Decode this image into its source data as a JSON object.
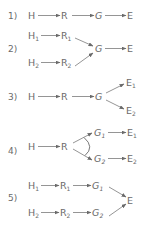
{
  "diagram": {
    "colors": {
      "text": "#6a6a6a",
      "line": "#7a7a7a",
      "background": "#ffffff"
    },
    "rows": [
      {
        "label": "1)",
        "nodes": [
          {
            "id": "H",
            "text": "H",
            "sub": ""
          },
          {
            "id": "R",
            "text": "R",
            "sub": ""
          },
          {
            "id": "G",
            "text": "G",
            "sub": ""
          },
          {
            "id": "E",
            "text": "E",
            "sub": ""
          }
        ],
        "edges": [
          [
            "H",
            "R"
          ],
          [
            "R",
            "G"
          ],
          [
            "G",
            "E"
          ]
        ]
      },
      {
        "label": "2)",
        "nodes": [
          {
            "id": "H1",
            "text": "H",
            "sub": "1"
          },
          {
            "id": "R1",
            "text": "R",
            "sub": "1"
          },
          {
            "id": "H2",
            "text": "H",
            "sub": "2"
          },
          {
            "id": "R2",
            "text": "R",
            "sub": "2"
          },
          {
            "id": "G",
            "text": "G",
            "sub": ""
          },
          {
            "id": "E",
            "text": "E",
            "sub": ""
          }
        ],
        "edges": [
          [
            "H1",
            "R1"
          ],
          [
            "H2",
            "R2"
          ],
          [
            "R1",
            "G"
          ],
          [
            "R2",
            "G"
          ],
          [
            "G",
            "E"
          ]
        ]
      },
      {
        "label": "3)",
        "nodes": [
          {
            "id": "H",
            "text": "H",
            "sub": ""
          },
          {
            "id": "R",
            "text": "R",
            "sub": ""
          },
          {
            "id": "G",
            "text": "G",
            "sub": ""
          },
          {
            "id": "E1",
            "text": "E",
            "sub": "1"
          },
          {
            "id": "E2",
            "text": "E",
            "sub": "2"
          }
        ],
        "edges": [
          [
            "H",
            "R"
          ],
          [
            "R",
            "G"
          ],
          [
            "G",
            "E1"
          ],
          [
            "G",
            "E2"
          ]
        ]
      },
      {
        "label": "4)",
        "nodes": [
          {
            "id": "H",
            "text": "H",
            "sub": ""
          },
          {
            "id": "R",
            "text": "R",
            "sub": ""
          },
          {
            "id": "G1",
            "text": "G",
            "sub": "1"
          },
          {
            "id": "G2",
            "text": "G",
            "sub": "2"
          },
          {
            "id": "E1",
            "text": "E",
            "sub": "1"
          },
          {
            "id": "E2",
            "text": "E",
            "sub": "2"
          }
        ],
        "edges": [
          [
            "H",
            "R"
          ],
          [
            "R",
            "G1"
          ],
          [
            "R",
            "G2"
          ],
          [
            "G1",
            "E1"
          ],
          [
            "G2",
            "E2"
          ]
        ],
        "annotation": "arc connecting R→G1 and R→G2 branches"
      },
      {
        "label": "5)",
        "nodes": [
          {
            "id": "H1",
            "text": "H",
            "sub": "1"
          },
          {
            "id": "R1",
            "text": "R",
            "sub": "1"
          },
          {
            "id": "G1",
            "text": "G",
            "sub": "1"
          },
          {
            "id": "H2",
            "text": "H",
            "sub": "2"
          },
          {
            "id": "R2",
            "text": "R",
            "sub": "2"
          },
          {
            "id": "G2",
            "text": "G",
            "sub": "2"
          },
          {
            "id": "E",
            "text": "E",
            "sub": ""
          }
        ],
        "edges": [
          [
            "H1",
            "R1"
          ],
          [
            "R1",
            "G1"
          ],
          [
            "H2",
            "R2"
          ],
          [
            "R2",
            "G2"
          ],
          [
            "G1",
            "E"
          ],
          [
            "G2",
            "E"
          ]
        ]
      }
    ]
  }
}
